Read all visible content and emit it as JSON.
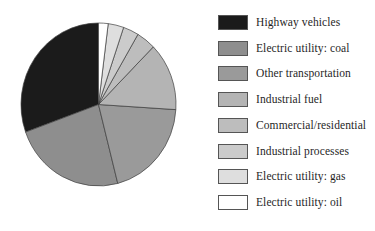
{
  "chart_data": {
    "type": "pie",
    "title": "",
    "legend_position": "right",
    "start_angle_deg": 0,
    "direction": "counterclockwise",
    "values_note": "no numeric labels shown in figure; percentages estimated from slice angles",
    "slices": [
      {
        "label": "Highway vehicles",
        "value": 30.5,
        "color": "#1b1b1b"
      },
      {
        "label": "Electric utility: coal",
        "value": 23.5,
        "color": "#8e8e8e"
      },
      {
        "label": "Other transportation",
        "value": 20.0,
        "color": "#9a9a9a"
      },
      {
        "label": "Industrial fuel",
        "value": 13.5,
        "color": "#b4b4b4"
      },
      {
        "label": "Commercial/residential",
        "value": 4.0,
        "color": "#bdbdbd"
      },
      {
        "label": "Industrial processes",
        "value": 3.25,
        "color": "#cbcbcb"
      },
      {
        "label": "Electric utility: gas",
        "value": 3.25,
        "color": "#dedede"
      },
      {
        "label": "Electric utility: oil",
        "value": 2.0,
        "color": "#ffffff"
      }
    ],
    "outline_color": "#3d3d3d",
    "background_color": "#ffffff"
  }
}
